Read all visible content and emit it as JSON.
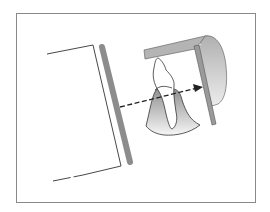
{
  "diagram": {
    "type": "dental-radiography-projection",
    "components": [
      {
        "id": "tube-cone",
        "label": ""
      },
      {
        "id": "collimator-plate",
        "label": ""
      },
      {
        "id": "central-ray-arrow",
        "label": ""
      },
      {
        "id": "tooth",
        "label": ""
      },
      {
        "id": "gingiva",
        "label": ""
      },
      {
        "id": "film-holder-bite-block",
        "label": ""
      },
      {
        "id": "film-packet",
        "label": ""
      }
    ],
    "colors": {
      "frame": "#8a8a8a",
      "collimator": "#8c8c8c",
      "holder": "#b4b4b4",
      "holder_shadow": "#c8c8c8",
      "film": "#9a9a9a",
      "gingiva_dark": "#9a9a9a",
      "gingiva_light": "#f4f4f4",
      "line": "#333333"
    }
  }
}
